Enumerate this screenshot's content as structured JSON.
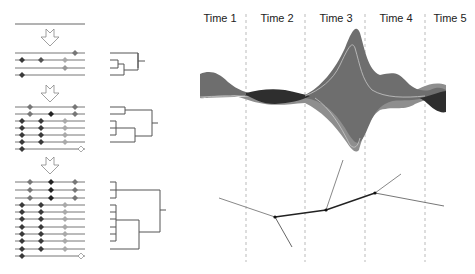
{
  "time_labels": [
    "Time 1",
    "Time 2",
    "Time 3",
    "Time 4",
    "Time 5"
  ],
  "colors": {
    "line": "#666666",
    "branch": "#555555",
    "marker_dark": "#3a3a3a",
    "marker_mid": "#777777",
    "marker_light": "#aaaaaa",
    "marker_hollow": "#ffffff",
    "stream_mid": "#6e6e6e",
    "stream_dark": "#2e2e2e",
    "stream_light": "#8e8e8e",
    "stream_edge": "#c8c8c8",
    "divider": "#aaaaaa",
    "tree_main": "#222222",
    "tree_side": "#888888"
  },
  "panels": [
    {
      "id": "stage-0",
      "lines": 1
    },
    {
      "id": "stage-1",
      "lines": 4
    },
    {
      "id": "stage-2",
      "lines": 7
    },
    {
      "id": "stage-3",
      "lines": 11
    }
  ]
}
